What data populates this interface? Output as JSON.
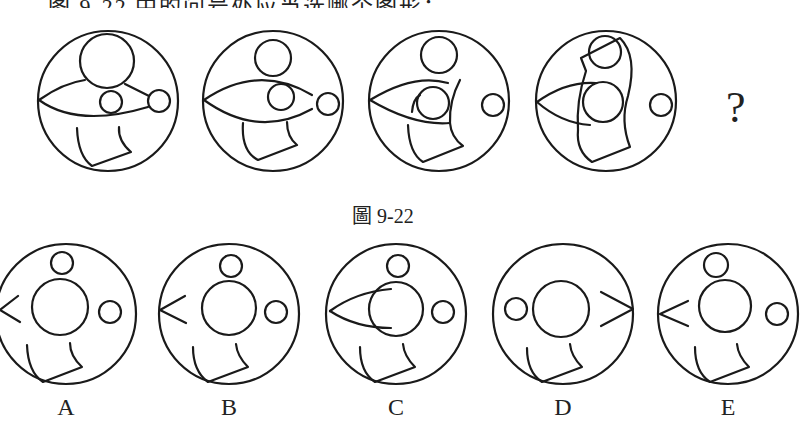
{
  "header": {
    "cut_text": "……图 9-22 中的问号处应当选哪个图形："
  },
  "puzzle": {
    "caption": "圖 9-22",
    "question_mark": "?",
    "figures": [
      {
        "id": "seq-1",
        "cx": 108,
        "cy": 101,
        "r": 70,
        "circles": [
          [
            -1,
            -40,
            27
          ],
          [
            3,
            1,
            11
          ],
          [
            51,
            0,
            11
          ]
        ],
        "paths": [
          "M -69,-1 Q -45,-18 -23,-21",
          "M -69,-1 Q -30,27 40,6",
          "M 17,-17 L 41,-5",
          "M -31,27 Q -30,55 -16,65 L 23,51 Q 10,40 11,26"
        ]
      },
      {
        "id": "seq-2",
        "cx": 273,
        "cy": 101,
        "r": 70,
        "circles": [
          [
            0,
            -43,
            18
          ],
          [
            8,
            -4,
            13
          ],
          [
            55,
            3,
            11
          ]
        ],
        "paths": [
          "M -69,-1 Q -15,-38 39,-6",
          "M -69,-1 Q -15,38 39,8",
          "M -30,22 Q -32,50 -15,59 L 24,44 Q 14,36 14,21"
        ]
      },
      {
        "id": "seq-3",
        "cx": 439,
        "cy": 101,
        "r": 70,
        "circles": [
          [
            0,
            -46,
            18
          ],
          [
            -6,
            2,
            16
          ],
          [
            54,
            4,
            11
          ]
        ],
        "paths": [
          "M -69,-1 Q -25,-28 9,-18",
          "M -69,-1 Q -25,25 11,22",
          "M -27,11 Q -26,-2 -19,-6",
          "M 21,-21 Q 10,0 11,22",
          "M -31,24 Q -30,52 -16,61 L 24,45 Q 12,36 11,22"
        ]
      },
      {
        "id": "seq-4",
        "cx": 606,
        "cy": 101,
        "r": 70,
        "circles": [
          [
            -1,
            -49,
            16
          ],
          [
            -3,
            1,
            20
          ],
          [
            55,
            4,
            11
          ]
        ],
        "paths": [
          "M -69,1 Q -40,-20 -10,-18",
          "M -69,1 Q -45,22 -16,24",
          "M -25,-43 L 14,-63 Q 32,-45 22,-5 Q 14,20 24,46 L -14,61 Q -30,50 -28,29 Q -30,0 -20,-30 Z"
        ]
      }
    ],
    "options": [
      {
        "label": "A",
        "cx": 66,
        "cy": 314,
        "r": 70,
        "circles": [
          [
            -4,
            -51,
            11
          ],
          [
            -6,
            -7,
            28
          ],
          [
            44,
            -2,
            11
          ]
        ],
        "paths": [
          "M -48,-18 L -66,-4 L -46,8",
          "M -39,31 Q -38,58 -23,68 L 16,53 Q 4,42 4,29"
        ]
      },
      {
        "label": "B",
        "cx": 229,
        "cy": 314,
        "r": 70,
        "circles": [
          [
            2,
            -48,
            11
          ],
          [
            0,
            -6,
            27
          ],
          [
            47,
            -2,
            11
          ]
        ],
        "paths": [
          "M -44,-18 L -69,-4 L -43,9",
          "M -36,33 Q -36,57 -21,68 L 19,53 Q 8,42 7,30"
        ]
      },
      {
        "label": "C",
        "cx": 396,
        "cy": 314,
        "r": 70,
        "circles": [
          [
            2,
            -48,
            11
          ],
          [
            0,
            -5,
            27
          ],
          [
            47,
            -2,
            11
          ]
        ],
        "paths": [
          "M -66,-3 Q -40,-22 -5,-25",
          "M -66,-3 Q -40,14 -5,14",
          "M -36,33 Q -36,58 -21,68 L 19,53 Q 8,42 7,30"
        ]
      },
      {
        "label": "D",
        "cx": 563,
        "cy": 314,
        "r": 70,
        "circles": [
          [
            -47,
            -5,
            11
          ],
          [
            -2,
            -5,
            28
          ]
        ],
        "paths": [
          "M 38,-22 L 70,-5 L 38,12",
          "M -36,34 Q -36,58 -21,68 L 19,53 Q 8,42 7,30"
        ]
      },
      {
        "label": "E",
        "cx": 728,
        "cy": 314,
        "r": 70,
        "circles": [
          [
            -12,
            -49,
            12
          ],
          [
            -3,
            -8,
            26
          ],
          [
            49,
            0,
            11
          ]
        ],
        "paths": [
          "M -40,-13 L -68,0 L -40,12",
          "M -33,33 Q -33,58 -18,68 L 21,53 Q 10,42 9,30"
        ]
      }
    ]
  }
}
